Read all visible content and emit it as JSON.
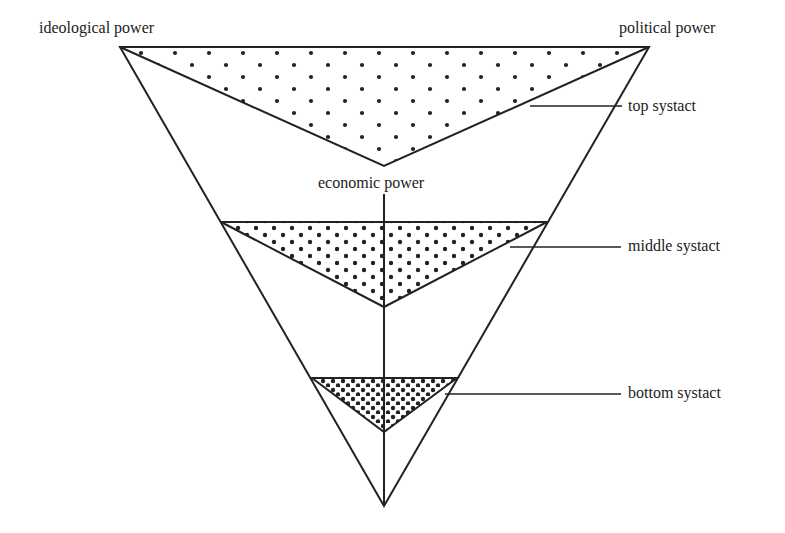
{
  "diagram": {
    "type": "inverted-triangle power diagram",
    "labels": {
      "ideological": "ideological power",
      "political": "political power",
      "economic": "economic power",
      "top_systact": "top systact",
      "middle_systact": "middle systact",
      "bottom_systact": "bottom systact"
    },
    "colors": {
      "line": "#222222",
      "dot": "#222222",
      "background": "#ffffff"
    },
    "regions": [
      {
        "name": "top systact",
        "density": "sparse"
      },
      {
        "name": "middle systact",
        "density": "medium"
      },
      {
        "name": "bottom systact",
        "density": "dense"
      }
    ]
  }
}
